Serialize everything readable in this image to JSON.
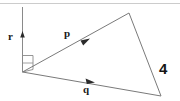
{
  "figure": {
    "kind": "vector-triangle-diagram",
    "background_color": "#ffffff",
    "stroke_color": "#7a7a7a",
    "label_color": "#1a1a1a",
    "top_rule_color": "#cccccc",
    "labels": {
      "r": "r",
      "p": "p",
      "q": "q",
      "side_length": "4"
    },
    "geometry": {
      "apex": [
        22,
        72
      ],
      "top_vertex": [
        129,
        13
      ],
      "right_vertex": [
        161,
        96
      ],
      "r_axis_top": [
        22,
        8
      ],
      "r_arrow_tip": [
        22,
        33
      ],
      "p_arrow_at": [
        84,
        43
      ],
      "q_arrow_at": [
        89,
        82
      ],
      "right_angle_marker": [
        [
          22,
          55
        ],
        [
          33,
          55
        ],
        [
          33,
          69
        ],
        [
          22,
          72
        ]
      ]
    },
    "vectors": [
      {
        "name": "r",
        "label": "r",
        "direction": "up",
        "from": [
          22,
          72
        ],
        "to": [
          22,
          8
        ]
      },
      {
        "name": "p",
        "label": "p",
        "direction": "up-right",
        "from": [
          22,
          72
        ],
        "to": [
          129,
          13
        ]
      },
      {
        "name": "q",
        "label": "q",
        "direction": "down-right",
        "from": [
          22,
          72
        ],
        "to": [
          161,
          96
        ]
      }
    ],
    "annotations": [
      {
        "name": "side-length-4",
        "text": "4",
        "near": "right-side"
      }
    ]
  }
}
